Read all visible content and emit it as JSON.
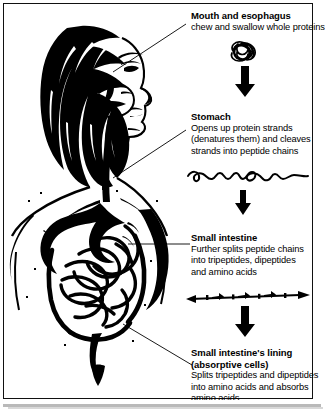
{
  "figure": {
    "ink_color": "#000000",
    "background_color": "#ffffff"
  },
  "illustration": {
    "name": "woman-digestive-tract-profile",
    "description": "Line drawing of a woman in profile showing mouth, esophagus, stomach and intestines"
  },
  "steps": [
    {
      "id": "mouth",
      "heading": "Mouth and esophagus",
      "lines": [
        "chew and swallow whole proteins"
      ],
      "graphic": "tangled-protein-ball"
    },
    {
      "id": "stomach",
      "heading": "Stomach",
      "lines": [
        "Opens up protein strands",
        "(denatures them) and cleaves",
        "strands into peptide chains"
      ],
      "graphic": "unraveled-protein-strand"
    },
    {
      "id": "small-intestine",
      "heading": "Small intestine",
      "lines": [
        "Further splits peptide chains",
        "into tripeptides, dipeptides",
        "and amino acids"
      ],
      "graphic": "segmented-peptide-chain"
    },
    {
      "id": "lining",
      "heading": "Small intestine's lining",
      "heading2": "(absorptive cells)",
      "lines": [
        "Splits tripeptides and dipeptides",
        "into amino acids and absorbs",
        "amino acids"
      ],
      "graphic": null
    }
  ],
  "flow_arrows": [
    {
      "id": "arrow-1",
      "from": "mouth",
      "to": "stomach",
      "direction": "down"
    },
    {
      "id": "arrow-2",
      "from": "stomach",
      "to": "small-intestine",
      "direction": "down"
    },
    {
      "id": "arrow-3",
      "from": "small-intestine",
      "to": "lining",
      "direction": "down"
    }
  ]
}
